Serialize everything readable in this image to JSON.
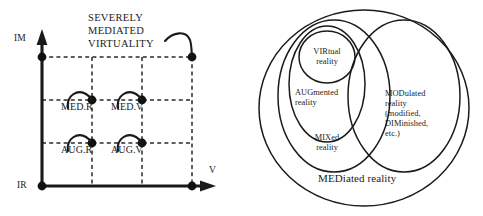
{
  "figure": {
    "left_panel": {
      "title_lines": [
        "SEVERELY",
        "MEDIATED",
        "VIRTUALITY"
      ],
      "y_axis_top_label": "IM",
      "y_axis_bottom_label": "IR",
      "x_axis_label": "V",
      "nodes": [
        {
          "label": "MED.R"
        },
        {
          "label": "MED.V"
        },
        {
          "label": "AUG.R"
        },
        {
          "label": "AUG.V"
        }
      ],
      "grid": {
        "columns": 4,
        "rows": 4
      },
      "colors": {
        "ink": "#1a1a1a",
        "grid": "#2a2a2a"
      }
    },
    "right_panel": {
      "regions": [
        {
          "name": "virtual-reality",
          "lines": [
            "VIRtual",
            "reality"
          ]
        },
        {
          "name": "augmented-reality",
          "lines": [
            "AUGmented",
            "reality"
          ]
        },
        {
          "name": "mixed-reality",
          "lines": [
            "MIXed",
            "reality"
          ]
        },
        {
          "name": "modulated-reality",
          "lines": [
            "MODulated",
            "reality",
            "(modified,",
            "DIMinished,",
            "etc.)"
          ]
        }
      ],
      "outer_label": "MEDiated reality",
      "colors": {
        "ink": "#1a1a1a"
      }
    }
  }
}
